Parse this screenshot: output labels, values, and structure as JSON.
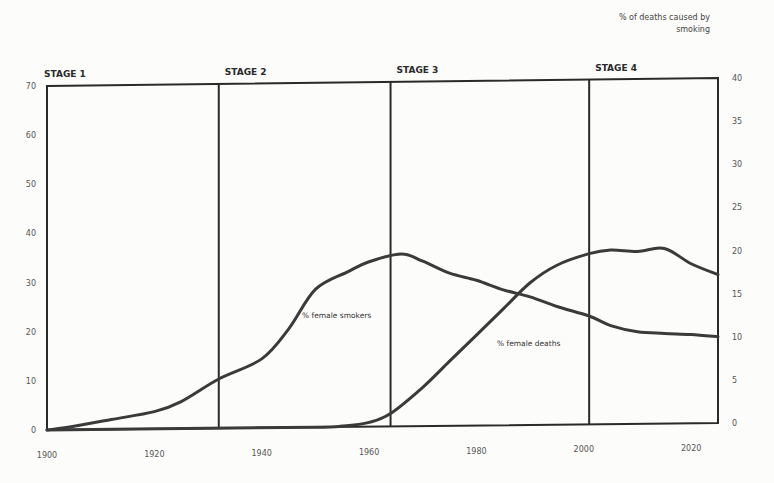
{
  "chart_data": {
    "type": "line",
    "title": "",
    "xlabel": "",
    "ylabel_left": "",
    "ylabel_right": "% of deaths caused by smoking",
    "x_ticks": [
      1900,
      1920,
      1940,
      1960,
      1980,
      2000,
      2020
    ],
    "x_tick_labels": [
      "1900",
      "1920",
      "1940",
      "1960",
      "1980",
      "2000",
      "2020"
    ],
    "xlim": [
      1900,
      2025
    ],
    "ylim_left": [
      0,
      70
    ],
    "y_ticks_left": [
      0,
      10,
      20,
      30,
      40,
      50,
      60,
      70
    ],
    "ylim_right": [
      0,
      40
    ],
    "y_ticks_right": [
      0,
      5,
      10,
      15,
      20,
      25,
      30,
      35,
      40
    ],
    "grid": false,
    "legend": "inline labels",
    "stages": [
      {
        "label": "STAGE 1",
        "start": 1900
      },
      {
        "label": "STAGE 2",
        "start": 1932
      },
      {
        "label": "STAGE 3",
        "start": 1964
      },
      {
        "label": "STAGE 4",
        "start": 2001
      }
    ],
    "series": [
      {
        "name": "% female smokers",
        "axis": "left",
        "x": [
          1900,
          1905,
          1912,
          1920,
          1925,
          1932,
          1940,
          1945,
          1950,
          1956,
          1960,
          1966,
          1970,
          1975,
          1980,
          1985,
          1990,
          1995,
          2001,
          2005,
          2010,
          2015,
          2020,
          2025
        ],
        "values": [
          0,
          0.7,
          2,
          3.5,
          5.5,
          10,
          14,
          20,
          28,
          31.5,
          33.5,
          35,
          33.5,
          31,
          29.5,
          27.5,
          26,
          24,
          22,
          20,
          18.7,
          18.3,
          18,
          17.5
        ]
      },
      {
        "name": "% female deaths",
        "axis": "right",
        "x": [
          1900,
          1930,
          1950,
          1955,
          1960,
          1964,
          1970,
          1975,
          1980,
          1985,
          1990,
          1995,
          2001,
          2005,
          2010,
          2015,
          2020,
          2025
        ],
        "values": [
          0,
          0,
          0,
          0.1,
          0.5,
          1.5,
          4.5,
          7.5,
          10.5,
          13.5,
          16.5,
          18.5,
          19.8,
          20.2,
          20,
          20.3,
          18.5,
          17.2
        ]
      }
    ]
  },
  "labels": {
    "right_axis_title_line1": "% of deaths caused by",
    "right_axis_title_line2": "smoking",
    "smokers_label": "% female smokers",
    "deaths_label": "% female deaths"
  }
}
